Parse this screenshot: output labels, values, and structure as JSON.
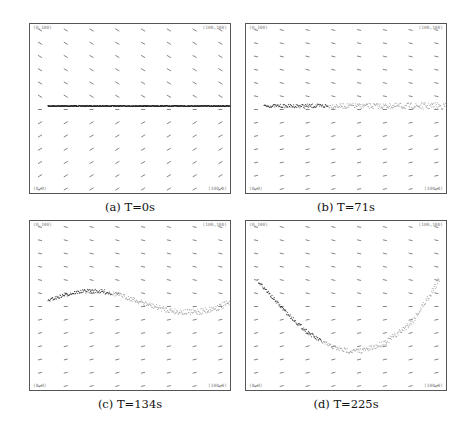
{
  "figure": {
    "panels": [
      {
        "id": "a",
        "caption": "(a) T=0s",
        "corners": {
          "tl": "(0,100)",
          "tr": "(100,100)",
          "bl": "(0,0)",
          "br": "(100,0)"
        },
        "curve": "flat"
      },
      {
        "id": "b",
        "caption": "(b) T=71s",
        "corners": {
          "tl": "(0,100)",
          "tr": "(100,100)",
          "bl": "(0,0)",
          "br": "(100,0)"
        },
        "curve": "flat-spread"
      },
      {
        "id": "c",
        "caption": "(c) T=134s",
        "corners": {
          "tl": "(0,100)",
          "tr": "(100,100)",
          "bl": "(0,0)",
          "br": "(100,0)"
        },
        "curve": "s-wave"
      },
      {
        "id": "d",
        "caption": "(d) T=225s",
        "corners": {
          "tl": "(0,100)",
          "tr": "(100,100)",
          "bl": "(0,0)",
          "br": "(100,0)"
        },
        "curve": "u-shape"
      }
    ],
    "grid": {
      "columns": 8,
      "rows": 13
    },
    "colors": {
      "frame": "#555555",
      "arrow": "#666666",
      "particles_dark": "#222222",
      "particles_light": "#999999"
    }
  }
}
